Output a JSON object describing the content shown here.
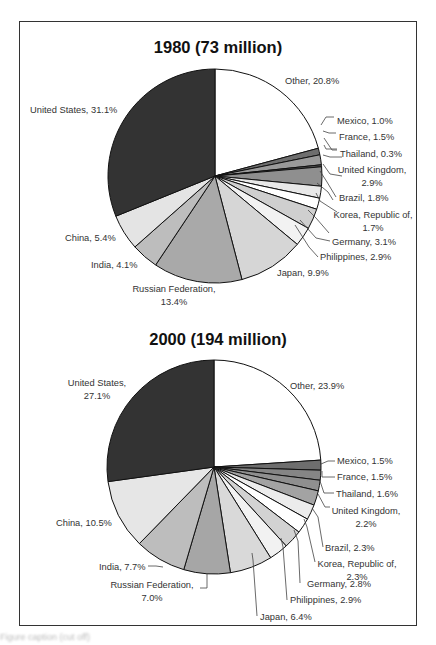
{
  "chart_data": [
    {
      "type": "pie",
      "title": "1980 (73 million)",
      "start_angle_deg": 0,
      "direction": "clockwise",
      "slices": [
        {
          "label": "Other",
          "value": 20.8,
          "text": "Other, 20.8%",
          "color": "#ffffff"
        },
        {
          "label": "Mexico",
          "value": 1.0,
          "text": "Mexico, 1.0%",
          "color": "#6e6e6e"
        },
        {
          "label": "France",
          "value": 1.5,
          "text": "France, 1.5%",
          "color": "#9a9a9a"
        },
        {
          "label": "Thailand",
          "value": 0.3,
          "text": "Thailand, 0.3%",
          "color": "#555555"
        },
        {
          "label": "United Kingdom",
          "value": 2.9,
          "text": "United Kingdom, 2.9%",
          "color": "#8f8f8f"
        },
        {
          "label": "Brazil",
          "value": 1.8,
          "text": "Brazil, 1.8%",
          "color": "#e8e8e8"
        },
        {
          "label": "Korea, Republic of",
          "value": 1.7,
          "text": "Korea, Republic of, 1.7%",
          "color": "#ffffff"
        },
        {
          "label": "Germany",
          "value": 3.1,
          "text": "Germany, 3.1%",
          "color": "#cfcfcf"
        },
        {
          "label": "Philippines",
          "value": 2.9,
          "text": "Philippines, 2.9%",
          "color": "#f2f2f2"
        },
        {
          "label": "Japan",
          "value": 9.9,
          "text": "Japan, 9.9%",
          "color": "#d6d6d6"
        },
        {
          "label": "Russian Federation",
          "value": 13.4,
          "text": "Russian Federation, 13.4%",
          "color": "#a9a9a9"
        },
        {
          "label": "India",
          "value": 4.1,
          "text": "India, 4.1%",
          "color": "#bdbdbd"
        },
        {
          "label": "China",
          "value": 5.4,
          "text": "China, 5.4%",
          "color": "#e4e4e4"
        },
        {
          "label": "United States",
          "value": 31.1,
          "text": "United States, 31.1%",
          "color": "#333333"
        }
      ]
    },
    {
      "type": "pie",
      "title": "2000 (194 million)",
      "start_angle_deg": 0,
      "direction": "clockwise",
      "slices": [
        {
          "label": "Other",
          "value": 23.9,
          "text": "Other, 23.9%",
          "color": "#ffffff"
        },
        {
          "label": "Mexico",
          "value": 1.5,
          "text": "Mexico, 1.5%",
          "color": "#6e6e6e"
        },
        {
          "label": "France",
          "value": 1.5,
          "text": "France, 1.5%",
          "color": "#858585"
        },
        {
          "label": "Thailand",
          "value": 1.6,
          "text": "Thailand, 1.6%",
          "color": "#8f8f8f"
        },
        {
          "label": "United Kingdom",
          "value": 2.2,
          "text": "United Kingdom, 2.2%",
          "color": "#a3a3a3"
        },
        {
          "label": "Brazil",
          "value": 2.3,
          "text": "Brazil, 2.3%",
          "color": "#ececec"
        },
        {
          "label": "Korea, Republic of",
          "value": 2.3,
          "text": "Korea, Republic of, 2.3%",
          "color": "#ffffff"
        },
        {
          "label": "Germany",
          "value": 2.8,
          "text": "Germany, 2.8%",
          "color": "#d2d2d2"
        },
        {
          "label": "Philippines",
          "value": 2.9,
          "text": "Philippines, 2.9%",
          "color": "#f2f2f2"
        },
        {
          "label": "Japan",
          "value": 6.4,
          "text": "Japan, 6.4%",
          "color": "#d9d9d9"
        },
        {
          "label": "Russian Federation",
          "value": 7.0,
          "text": "Russian Federation, 7.0%",
          "color": "#a6a6a6"
        },
        {
          "label": "India",
          "value": 7.7,
          "text": "India, 7.7%",
          "color": "#bdbdbd"
        },
        {
          "label": "China",
          "value": 10.5,
          "text": "China, 10.5%",
          "color": "#e6e6e6"
        },
        {
          "label": "United States",
          "value": 27.1,
          "text": "United States, 27.1%",
          "color": "#333333"
        }
      ]
    }
  ],
  "charts": {
    "c1980": {
      "title": "1980 (73 million)",
      "labels": [
        {
          "lines": [
            "Other, 20.8%"
          ],
          "x": 285,
          "y": 84,
          "anchor": "start"
        },
        {
          "lines": [
            "United States, 31.1%"
          ],
          "x": 30,
          "y": 113,
          "anchor": "start"
        },
        {
          "lines": [
            "Mexico, 1.0%"
          ],
          "x": 337,
          "y": 124,
          "anchor": "start"
        },
        {
          "lines": [
            "France, 1.5%"
          ],
          "x": 339,
          "y": 140,
          "anchor": "start"
        },
        {
          "lines": [
            "Thailand, 0.3%"
          ],
          "x": 340,
          "y": 157,
          "anchor": "start"
        },
        {
          "lines": [
            "United Kingdom,",
            "2.9%"
          ],
          "x": 372,
          "y": 173,
          "anchor": "middle"
        },
        {
          "lines": [
            "Brazil, 1.8%"
          ],
          "x": 339,
          "y": 201,
          "anchor": "start"
        },
        {
          "lines": [
            "Korea, Republic of,",
            "1.7%"
          ],
          "x": 373,
          "y": 218,
          "anchor": "middle"
        },
        {
          "lines": [
            "Germany, 3.1%"
          ],
          "x": 332,
          "y": 245,
          "anchor": "start"
        },
        {
          "lines": [
            "Philippines, 2.9%"
          ],
          "x": 320,
          "y": 260,
          "anchor": "start"
        },
        {
          "lines": [
            "Japan, 9.9%"
          ],
          "x": 277,
          "y": 276,
          "anchor": "start"
        },
        {
          "lines": [
            "China, 5.4%"
          ],
          "x": 65,
          "y": 241,
          "anchor": "start"
        },
        {
          "lines": [
            "India, 4.1%"
          ],
          "x": 91,
          "y": 268,
          "anchor": "start"
        },
        {
          "lines": [
            "Russian Federation,",
            "13.4%"
          ],
          "x": 174,
          "y": 292,
          "anchor": "middle"
        }
      ],
      "leaders": [
        [
          [
            321,
            125
          ],
          [
            326,
            117
          ],
          [
            334,
            117
          ]
        ],
        [
          [
            323,
            131
          ],
          [
            329,
            133
          ],
          [
            336,
            133
          ]
        ],
        [
          [
            324,
            138
          ],
          [
            332,
            150
          ],
          [
            337,
            150
          ]
        ],
        [
          [
            324,
            145
          ],
          [
            326,
            149
          ],
          [
            337,
            149
          ]
        ],
        [
          [
            323,
            155
          ],
          [
            330,
            157
          ],
          [
            342,
            157
          ]
        ],
        [
          [
            323,
            164
          ],
          [
            330,
            174
          ],
          [
            342,
            176
          ]
        ],
        [
          [
            320,
            171
          ],
          [
            327,
            182
          ],
          [
            336,
            197
          ]
        ],
        [
          [
            317,
            183
          ],
          [
            328,
            192
          ],
          [
            333,
            200
          ]
        ],
        [
          [
            316,
            193
          ],
          [
            320,
            201
          ],
          [
            337,
            212
          ]
        ],
        [
          [
            308,
            210
          ],
          [
            316,
            218
          ],
          [
            329,
            233
          ]
        ],
        [
          [
            300,
            220
          ],
          [
            316,
            238
          ],
          [
            330,
            241
          ]
        ],
        [
          [
            295,
            225
          ],
          [
            309,
            247
          ],
          [
            318,
            257
          ]
        ]
      ]
    },
    "c2000": {
      "title": "2000 (194 million)",
      "labels": [
        {
          "lines": [
            "United States,",
            "27.1%"
          ],
          "x": 97,
          "y": 386,
          "anchor": "middle"
        },
        {
          "lines": [
            "Other, 23.9%"
          ],
          "x": 290,
          "y": 389,
          "anchor": "start"
        },
        {
          "lines": [
            "Mexico, 1.5%"
          ],
          "x": 337,
          "y": 464,
          "anchor": "start"
        },
        {
          "lines": [
            "France, 1.5%"
          ],
          "x": 337,
          "y": 480,
          "anchor": "start"
        },
        {
          "lines": [
            "Thailand, 1.6%"
          ],
          "x": 336,
          "y": 497,
          "anchor": "start"
        },
        {
          "lines": [
            "United Kingdom,",
            "2.2%"
          ],
          "x": 366,
          "y": 514,
          "anchor": "middle"
        },
        {
          "lines": [
            "Brazil, 2.3%"
          ],
          "x": 325,
          "y": 551,
          "anchor": "start"
        },
        {
          "lines": [
            "Korea, Republic of,",
            "2.3%"
          ],
          "x": 357,
          "y": 567,
          "anchor": "middle"
        },
        {
          "lines": [
            "Germany, 2.8%"
          ],
          "x": 307,
          "y": 587,
          "anchor": "start"
        },
        {
          "lines": [
            "Philippines, 2.9%"
          ],
          "x": 290,
          "y": 603,
          "anchor": "start"
        },
        {
          "lines": [
            "Japan, 6.4%"
          ],
          "x": 260,
          "y": 620,
          "anchor": "start"
        },
        {
          "lines": [
            "China, 10.5%"
          ],
          "x": 56,
          "y": 526,
          "anchor": "start"
        },
        {
          "lines": [
            "India, 7.7%"
          ],
          "x": 99,
          "y": 570,
          "anchor": "start"
        },
        {
          "lines": [
            "Russian Federation,",
            "7.0%"
          ],
          "x": 152,
          "y": 588,
          "anchor": "middle"
        }
      ],
      "leaders": [
        [
          [
            321,
            464
          ],
          [
            328,
            461
          ],
          [
            335,
            461
          ]
        ],
        [
          [
            322,
            471
          ],
          [
            322,
            477
          ],
          [
            335,
            477
          ]
        ],
        [
          [
            320,
            481
          ],
          [
            324,
            493
          ],
          [
            334,
            493
          ]
        ],
        [
          [
            318,
            494
          ],
          [
            325,
            507
          ],
          [
            330,
            507
          ]
        ],
        [
          [
            312,
            508
          ],
          [
            318,
            517
          ],
          [
            323,
            547
          ]
        ],
        [
          [
            304,
            519
          ],
          [
            307,
            527
          ],
          [
            315,
            562
          ]
        ],
        [
          [
            294,
            530
          ],
          [
            298,
            541
          ],
          [
            300,
            583
          ]
        ],
        [
          [
            281,
            538
          ],
          [
            283,
            547
          ],
          [
            287,
            600
          ]
        ],
        [
          [
            252,
            553
          ],
          [
            253,
            560
          ],
          [
            257,
            616
          ]
        ],
        [
          [
            207,
            574
          ],
          [
            207,
            588
          ],
          [
            200,
            588
          ]
        ],
        [
          [
            163,
            567
          ],
          [
            156,
            566
          ],
          [
            148,
            566
          ]
        ]
      ]
    }
  },
  "caption": "Figure caption (cut off)"
}
